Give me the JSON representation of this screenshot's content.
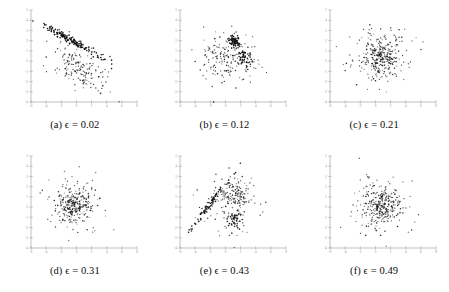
{
  "figure": {
    "type": "scatter-matrix",
    "panel_count": 6,
    "rows": 2,
    "cols": 3,
    "background_color": "#ffffff",
    "dot_color": "#111111",
    "axis_color": "#a8a8a8",
    "tick_label_color": "#8d8d8d"
  },
  "panels": [
    {
      "id": "a",
      "label": "(a)",
      "symbol": "ϵ",
      "equals": "=",
      "value": "0.02",
      "caption": "(a) ϵ = 0.02",
      "description": "dense narrow downward-sloping linear band in upper region with diffuse scattered cloud below"
    },
    {
      "id": "b",
      "label": "(b)",
      "symbol": "ϵ",
      "equals": "=",
      "value": "0.12",
      "caption": "(b) ϵ = 0.12",
      "description": "tight dark cluster upper-center-right with second smaller cluster right of center and diffuse surrounding cloud"
    },
    {
      "id": "c",
      "label": "(c)",
      "symbol": "ϵ",
      "equals": "=",
      "value": "0.21",
      "caption": "(c) ϵ = 0.21",
      "description": "broad diffuse central blob with no distinct sub-cluster"
    },
    {
      "id": "d",
      "label": "(d)",
      "symbol": "ϵ",
      "equals": "=",
      "value": "0.31",
      "caption": "(d) ϵ = 0.31",
      "description": "roughly circular diffuse cloud with denser core left of center"
    },
    {
      "id": "e",
      "label": "(e)",
      "symbol": "ϵ",
      "equals": "=",
      "value": "0.43",
      "caption": "(e) ϵ = 0.43",
      "description": "upward-sloping linear streak from lower-left joining dense clusters at center-right and a compact clump lower-right"
    },
    {
      "id": "f",
      "label": "(f)",
      "symbol": "ϵ",
      "equals": "=",
      "value": "0.49",
      "caption": "(f) ϵ = 0.49",
      "description": "dense round central cloud with scattered outliers"
    }
  ],
  "chart_data": {
    "type": "scatter",
    "title": "",
    "xlabel": "",
    "ylabel": "",
    "grid": false,
    "legend": "none",
    "shared_axes": {
      "xlim": [
        -6,
        8
      ],
      "ylim": [
        -4,
        5
      ],
      "xticks": [
        -6,
        -4,
        -2,
        0,
        2,
        4,
        6,
        8
      ],
      "yticks": [
        -4,
        -3,
        -2,
        -1,
        0,
        1,
        2,
        3,
        4,
        5
      ],
      "xtick_labels": [
        "-6",
        "-4",
        "-2",
        "0",
        "2",
        "4",
        "6",
        "8"
      ],
      "ytick_labels": [
        "-4",
        "-3",
        "-2",
        "-1",
        "0",
        "1",
        "2",
        "3",
        "4",
        "5"
      ]
    },
    "panels": [
      {
        "id": "a",
        "caption": "(a) ϵ = 0.02",
        "n_points": 320,
        "clusters": [
          {
            "name": "linear-band",
            "n": 150,
            "cx": -0.6,
            "cy": 2.0,
            "sx": 2.0,
            "sy": 0.18,
            "slope": -0.42,
            "weight": 0.47
          },
          {
            "name": "diffuse-cloud",
            "n": 170,
            "cx": 0.4,
            "cy": -0.7,
            "sx": 1.9,
            "sy": 1.0,
            "slope": -0.3,
            "weight": 0.53
          }
        ]
      },
      {
        "id": "b",
        "caption": "(b) ϵ = 0.12",
        "n_points": 300,
        "clusters": [
          {
            "name": "tight-cluster",
            "n": 70,
            "cx": 1.2,
            "cy": 1.9,
            "sx": 0.42,
            "sy": 0.3,
            "slope": 0.0,
            "weight": 0.23
          },
          {
            "name": "second-cluster",
            "n": 45,
            "cx": 2.5,
            "cy": 0.3,
            "sx": 0.45,
            "sy": 0.45,
            "slope": 0.0,
            "weight": 0.15
          },
          {
            "name": "diffuse-cloud",
            "n": 185,
            "cx": 0.1,
            "cy": 0.4,
            "sx": 1.9,
            "sy": 1.3,
            "slope": 0.0,
            "weight": 0.62
          }
        ]
      },
      {
        "id": "c",
        "caption": "(c) ϵ = 0.21",
        "n_points": 330,
        "clusters": [
          {
            "name": "core",
            "n": 200,
            "cx": 0.9,
            "cy": 0.4,
            "sx": 1.2,
            "sy": 0.9,
            "slope": 0.0,
            "weight": 0.61
          },
          {
            "name": "halo",
            "n": 130,
            "cx": 0.7,
            "cy": 0.5,
            "sx": 2.1,
            "sy": 1.5,
            "slope": 0.0,
            "weight": 0.39
          }
        ]
      },
      {
        "id": "d",
        "caption": "(d) ϵ = 0.31",
        "n_points": 320,
        "clusters": [
          {
            "name": "core",
            "n": 180,
            "cx": -0.4,
            "cy": 0.1,
            "sx": 1.0,
            "sy": 0.85,
            "slope": 0.0,
            "weight": 0.56
          },
          {
            "name": "halo",
            "n": 140,
            "cx": -0.1,
            "cy": 0.1,
            "sx": 2.0,
            "sy": 1.5,
            "slope": 0.0,
            "weight": 0.44
          }
        ]
      },
      {
        "id": "e",
        "caption": "(e) ϵ = 0.43",
        "n_points": 330,
        "clusters": [
          {
            "name": "linear-streak",
            "n": 80,
            "cx": -1.9,
            "cy": 0.4,
            "sx": 1.3,
            "sy": 0.22,
            "slope": 0.95,
            "weight": 0.24
          },
          {
            "name": "dense-center-right",
            "n": 130,
            "cx": 1.3,
            "cy": 1.2,
            "sx": 1.0,
            "sy": 0.9,
            "slope": 0.0,
            "weight": 0.39
          },
          {
            "name": "clump-lower-right",
            "n": 40,
            "cx": 1.2,
            "cy": -1.2,
            "sx": 0.42,
            "sy": 0.35,
            "slope": 0.0,
            "weight": 0.12
          },
          {
            "name": "halo",
            "n": 80,
            "cx": 0.6,
            "cy": 0.2,
            "sx": 2.0,
            "sy": 1.5,
            "slope": 0.0,
            "weight": 0.25
          }
        ]
      },
      {
        "id": "f",
        "caption": "(f) ϵ = 0.49",
        "n_points": 330,
        "clusters": [
          {
            "name": "core",
            "n": 200,
            "cx": 0.6,
            "cy": 0.2,
            "sx": 1.05,
            "sy": 0.95,
            "slope": 0.0,
            "weight": 0.61
          },
          {
            "name": "halo",
            "n": 130,
            "cx": 0.5,
            "cy": 0.3,
            "sx": 2.0,
            "sy": 1.5,
            "slope": 0.0,
            "weight": 0.39
          }
        ]
      }
    ]
  }
}
